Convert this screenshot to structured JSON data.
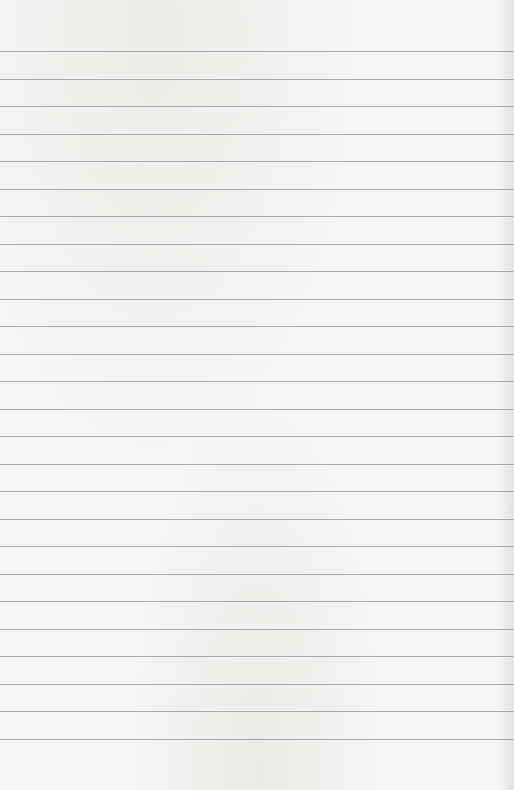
{
  "paper": {
    "background_color": "#f6f5f3",
    "line_color": "#a9a9a9",
    "line_count": 26,
    "first_line_y": 51,
    "line_spacing": 27.52
  }
}
